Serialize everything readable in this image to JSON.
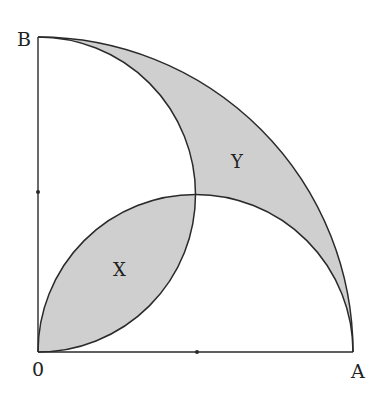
{
  "diagram": {
    "points": {
      "O": {
        "label": "0"
      },
      "A": {
        "label": "A"
      },
      "B": {
        "label": "B"
      }
    },
    "regions": {
      "X": {
        "label": "X"
      },
      "Y": {
        "label": "Y"
      }
    },
    "colors": {
      "stroke": "#2a2a2a",
      "shade": "#cfcfcf",
      "background": "#ffffff"
    }
  }
}
